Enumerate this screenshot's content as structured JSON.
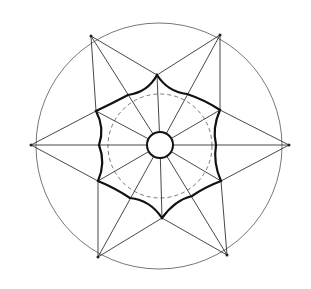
{
  "diagram": {
    "type": "geometric-construction",
    "colors": {
      "background": "#ffffff",
      "stroke": "#111111",
      "thin_stroke": "#555555"
    },
    "center": [
      160,
      145
    ],
    "outer_circle": {
      "cx": 159,
      "cy": 146,
      "r": 123
    },
    "dashed_circle": {
      "cx": 160,
      "cy": 146,
      "r": 52
    },
    "inner_circle": {
      "cx": 160,
      "cy": 145,
      "r": 13
    },
    "outer_points": [
      [
        91,
        36
      ],
      [
        220,
        35
      ],
      [
        289,
        145
      ],
      [
        227,
        255
      ],
      [
        98,
        257
      ],
      [
        31,
        145
      ]
    ],
    "star_vertices": [
      [
        157,
        75
      ],
      [
        187,
        94
      ],
      [
        220,
        110
      ],
      [
        216,
        145
      ],
      [
        221,
        181
      ],
      [
        192,
        196
      ],
      [
        162,
        218
      ],
      [
        130,
        198
      ],
      [
        98,
        181
      ],
      [
        99,
        145
      ],
      [
        96,
        111
      ],
      [
        128,
        95
      ]
    ]
  }
}
